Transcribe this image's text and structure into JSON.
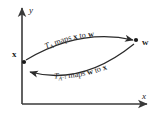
{
  "figure": {
    "axes": {
      "x_label": "x",
      "y_label": "y",
      "origin": {
        "x": 22,
        "y": 104
      },
      "x_axis_end": {
        "x": 152,
        "y": 104
      },
      "y_axis_end": {
        "x": 22,
        "y": 5
      },
      "color": "#3a3a3a"
    },
    "points": [
      {
        "name": "x-point",
        "label": "x",
        "x": 24,
        "y": 62,
        "label_x": 14,
        "label_y": 54
      },
      {
        "name": "w-point",
        "label": "w",
        "x": 136,
        "y": 40,
        "label_x": 143,
        "label_y": 45
      }
    ],
    "arcs": [
      {
        "name": "forward-arc",
        "direction": "x-to-w",
        "label_parts": {
          "t": "T",
          "sub": "A",
          "text_mid": " maps ",
          "from": "x",
          "to_word": " to ",
          "to": "w"
        },
        "label_plain": "T_A maps x to w"
      },
      {
        "name": "inverse-arc",
        "direction": "w-to-x",
        "label_parts": {
          "t": "T",
          "sub": "A",
          "sup": "−1",
          "text_mid": " maps ",
          "from": "w",
          "to_word": " to ",
          "to": "x"
        },
        "label_plain": "T_{A−1} maps w to x"
      }
    ],
    "curve_color": "#2b2b2b",
    "background": "#ffffff"
  }
}
